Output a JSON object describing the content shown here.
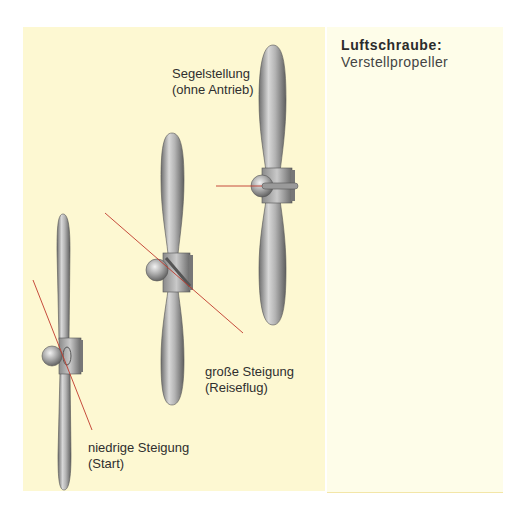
{
  "sidebar": {
    "title": "Luftschraube:",
    "subtitle": "Verstellpropeller"
  },
  "diagram": {
    "propellers": [
      {
        "id": "low-pitch",
        "label_line1": "niedrige Steigung",
        "label_line2": "(Start)"
      },
      {
        "id": "high-pitch",
        "label_line1": "große Steigung",
        "label_line2": "(Reiseflug)"
      },
      {
        "id": "feathered",
        "label_line1": "Segelstellung",
        "label_line2": "(ohne Antrieb)"
      }
    ]
  },
  "colors": {
    "panel_background": "#fdf8d2",
    "sidebar_background": "#fefde9",
    "pitch_line": "#c0392b",
    "blade_metal": "#a8a8a8"
  }
}
